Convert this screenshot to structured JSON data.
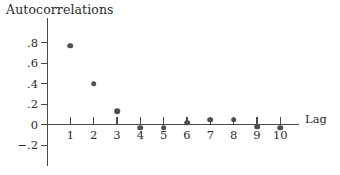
{
  "chart_data": {
    "type": "scatter",
    "title": "Autocorrelations",
    "xlabel": "Lag",
    "ylabel": "",
    "x": [
      1,
      2,
      3,
      4,
      5,
      6,
      7,
      8,
      9,
      10
    ],
    "values": [
      0.77,
      0.4,
      0.13,
      -0.03,
      -0.03,
      0.02,
      0.05,
      0.05,
      -0.02,
      -0.03
    ],
    "categories": [
      "1",
      "2",
      "3",
      "4",
      "5",
      "6",
      "7",
      "8",
      "9",
      "10"
    ],
    "series": [
      {
        "name": "Autocorrelation",
        "values": [
          0.77,
          0.4,
          0.13,
          -0.03,
          -0.03,
          0.02,
          0.05,
          0.05,
          -0.02,
          -0.03
        ]
      }
    ],
    "ylim": [
      -0.3,
      0.95
    ],
    "xlim": [
      0,
      10.8
    ],
    "yticks": [
      0.8,
      0.6,
      0.4,
      0.2,
      0,
      -0.2
    ],
    "ytick_labels": [
      ".8",
      ".6",
      ".4",
      ".2",
      "0",
      "−.2"
    ],
    "xticks": [
      1,
      2,
      3,
      4,
      5,
      6,
      7,
      8,
      9,
      10
    ],
    "xtick_labels": [
      "1",
      "2",
      "3",
      "4",
      "5",
      "6",
      "7",
      "8",
      "9",
      "10"
    ],
    "grid": false,
    "legend": false,
    "marker_color": "#4f4f4f",
    "axis_color": "#4a4a4a",
    "background_color": "#ffffff"
  }
}
